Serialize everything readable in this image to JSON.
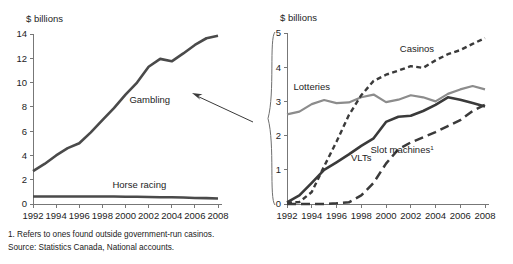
{
  "figure": {
    "width": 513,
    "height": 264,
    "background": "#ffffff"
  },
  "footnotes": {
    "note1": "1. Refers to ones found outside government-run casinos.",
    "source": "Source: Statistics Canada, National accounts."
  },
  "colors": {
    "gambling": "#4a4a4a",
    "horse_racing": "#4a4a4a",
    "lotteries": "#8c8c8c",
    "casinos": "#3a3a3a",
    "vlts": "#3a3a3a",
    "slot_machines": "#3a3a3a",
    "axis": "#777777",
    "text": "#1d1d1d"
  },
  "annotations": {
    "pointer_from_label": "Gambling",
    "pointer_target": "right-panel-brace"
  },
  "chart_data": [
    {
      "id": "left",
      "type": "line",
      "title": "",
      "xlabel": "",
      "ylabel": "$ billions",
      "axis_unit_label": "$ billions",
      "x": [
        1992,
        1993,
        1994,
        1995,
        1996,
        1997,
        1998,
        1999,
        2000,
        2001,
        2002,
        2003,
        2004,
        2005,
        2006,
        2007,
        2008
      ],
      "xlim": [
        1992,
        2008
      ],
      "ylim": [
        0,
        14
      ],
      "xticks": [
        1992,
        1994,
        1996,
        1998,
        2000,
        2002,
        2004,
        2006,
        2008
      ],
      "xtick_labels": [
        "1992",
        "1994",
        "1996",
        "1998",
        "2000",
        "2002",
        "2004",
        "2006",
        "2008"
      ],
      "yticks": [
        0,
        2,
        4,
        6,
        8,
        10,
        12,
        14
      ],
      "ytick_labels": [
        "0",
        "2",
        "4",
        "6",
        "8",
        "10",
        "12",
        "14"
      ],
      "grid": false,
      "legend_position": "inline-annotations",
      "series": [
        {
          "name": "Gambling",
          "label": "Gambling",
          "style": "solid",
          "color": "#4a4a4a",
          "width": 2.6,
          "label_x": 2002.1,
          "label_y": 8.35,
          "values": [
            2.7,
            3.3,
            4.0,
            4.6,
            5.0,
            5.9,
            6.9,
            7.9,
            9.0,
            10.0,
            11.3,
            11.95,
            11.75,
            12.4,
            13.1,
            13.65,
            13.85
          ]
        },
        {
          "name": "Horse racing",
          "label": "Horse racing",
          "style": "solid",
          "color": "#4a4a4a",
          "width": 2.6,
          "label_x": 2001.2,
          "label_y": 1.35,
          "values": [
            0.62,
            0.62,
            0.62,
            0.62,
            0.62,
            0.62,
            0.62,
            0.62,
            0.6,
            0.6,
            0.58,
            0.56,
            0.55,
            0.53,
            0.5,
            0.48,
            0.45
          ]
        }
      ]
    },
    {
      "id": "right",
      "type": "line",
      "title": "",
      "xlabel": "",
      "ylabel": "$ billions",
      "axis_unit_label": "$ billions",
      "x": [
        1992,
        1993,
        1994,
        1995,
        1996,
        1997,
        1998,
        1999,
        2000,
        2001,
        2002,
        2003,
        2004,
        2005,
        2006,
        2007,
        2008
      ],
      "xlim": [
        1992,
        2008
      ],
      "ylim": [
        0,
        5
      ],
      "xticks": [
        1992,
        1994,
        1996,
        1998,
        2000,
        2002,
        2004,
        2006,
        2008
      ],
      "xtick_labels": [
        "1992",
        "1994",
        "1996",
        "1998",
        "2000",
        "2002",
        "2004",
        "2006",
        "2008"
      ],
      "yticks": [
        0,
        1,
        2,
        3,
        4,
        5
      ],
      "ytick_labels": [
        "0",
        "1",
        "2",
        "3",
        "4",
        "5"
      ],
      "grid": false,
      "legend_position": "inline-annotations",
      "series": [
        {
          "name": "Lotteries",
          "label": "Lotteries",
          "style": "solid",
          "color": "#8c8c8c",
          "width": 2.2,
          "label_x": 1994.0,
          "label_y": 3.32,
          "values": [
            2.62,
            2.7,
            2.92,
            3.04,
            2.95,
            2.97,
            3.12,
            3.2,
            2.98,
            3.05,
            3.18,
            3.12,
            3.0,
            3.22,
            3.35,
            3.45,
            3.35
          ]
        },
        {
          "name": "Casinos",
          "label": "Casinos",
          "style": "dotted",
          "color": "#3a3a3a",
          "width": 2.4,
          "dash": "5,3.4",
          "label_x": 2002.5,
          "label_y": 4.45,
          "values": [
            0.03,
            0.06,
            0.35,
            1.1,
            1.82,
            2.6,
            3.18,
            3.6,
            3.78,
            3.9,
            4.03,
            3.98,
            4.2,
            4.38,
            4.5,
            4.68,
            4.85
          ]
        },
        {
          "name": "VLTs",
          "label": "VLTs",
          "style": "solid",
          "color": "#3a3a3a",
          "width": 2.6,
          "label_x": 1998.0,
          "label_y": 1.25,
          "values": [
            0.05,
            0.25,
            0.62,
            1.0,
            1.22,
            1.45,
            1.7,
            1.92,
            2.4,
            2.55,
            2.58,
            2.72,
            2.9,
            3.12,
            3.05,
            2.95,
            2.85
          ]
        },
        {
          "name": "Slot machines",
          "label": "Slot machines",
          "label_superscript": "1",
          "style": "dashed",
          "color": "#3a3a3a",
          "width": 2.5,
          "dash": "9,5",
          "label_x": 2001.3,
          "label_y": 1.5,
          "values": [
            0.0,
            0.0,
            0.0,
            0.0,
            0.02,
            0.05,
            0.25,
            0.62,
            1.18,
            1.6,
            1.8,
            1.95,
            2.1,
            2.28,
            2.45,
            2.72,
            2.9
          ]
        }
      ]
    }
  ]
}
